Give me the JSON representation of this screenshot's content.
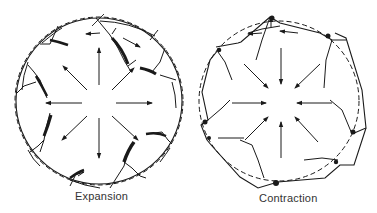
{
  "figure": {
    "panels": [
      {
        "id": "expansion",
        "caption": "Expansion",
        "arrow_direction": "outward",
        "original_boundary": "dashed circle",
        "deformed_boundary": "solid circle with crack-separated fragments"
      },
      {
        "id": "contraction",
        "caption": "Contraction",
        "arrow_direction": "inward",
        "original_boundary": "dashed circle",
        "deformed_boundary": "solid irregular polygon with overlapping fragments"
      }
    ]
  },
  "colors": {
    "ink": "#1a1a1a",
    "background": "#ffffff"
  }
}
